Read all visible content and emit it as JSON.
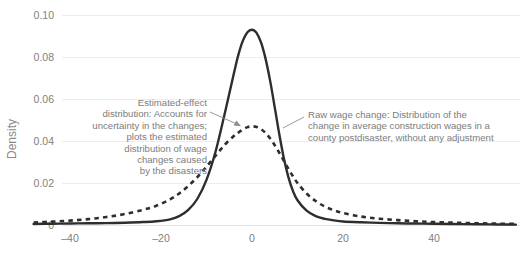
{
  "chart_data": {
    "type": "line",
    "title": "",
    "xlabel": "",
    "ylabel": "Density",
    "xlim": [
      -48,
      58
    ],
    "ylim": [
      0,
      0.104
    ],
    "grid": true,
    "legend_position": "none",
    "xticks": [
      -40,
      -20,
      0,
      20,
      40
    ],
    "xtick_labels": [
      "–40",
      "–20",
      "0",
      "20",
      "40"
    ],
    "yticks": [
      0,
      0.02,
      0.04,
      0.06,
      0.08,
      0.1
    ],
    "ytick_labels": [
      "0",
      "0.02",
      "0.04",
      "0.06",
      "0.08",
      "0.10"
    ],
    "series": [
      {
        "name": "Raw wage change",
        "style": "solid",
        "color": "#2e2e2e",
        "peak_x": 0.5,
        "peak_y": 0.093,
        "points": [
          [
            -48,
            0.0005
          ],
          [
            -44,
            0.0006
          ],
          [
            -40,
            0.0007
          ],
          [
            -36,
            0.0008
          ],
          [
            -32,
            0.0009
          ],
          [
            -28,
            0.0011
          ],
          [
            -24,
            0.0014
          ],
          [
            -21,
            0.0018
          ],
          [
            -18,
            0.0027
          ],
          [
            -16,
            0.0042
          ],
          [
            -14,
            0.0072
          ],
          [
            -12,
            0.0125
          ],
          [
            -10,
            0.0215
          ],
          [
            -8,
            0.035
          ],
          [
            -6,
            0.053
          ],
          [
            -4,
            0.072
          ],
          [
            -3,
            0.081
          ],
          [
            -2,
            0.0878
          ],
          [
            -1,
            0.0918
          ],
          [
            0,
            0.093
          ],
          [
            1,
            0.0915
          ],
          [
            2,
            0.0868
          ],
          [
            3,
            0.079
          ],
          [
            4,
            0.0685
          ],
          [
            5,
            0.056
          ],
          [
            6,
            0.0432
          ],
          [
            7,
            0.0318
          ],
          [
            8,
            0.0228
          ],
          [
            9,
            0.0162
          ],
          [
            10,
            0.0118
          ],
          [
            12,
            0.0068
          ],
          [
            14,
            0.0042
          ],
          [
            16,
            0.0029
          ],
          [
            18,
            0.0022
          ],
          [
            20,
            0.0017
          ],
          [
            24,
            0.0013
          ],
          [
            28,
            0.001
          ],
          [
            32,
            0.0008
          ],
          [
            36,
            0.0007
          ],
          [
            40,
            0.0006
          ],
          [
            46,
            0.0004
          ],
          [
            52,
            0.0003
          ],
          [
            58,
            0.0002
          ]
        ]
      },
      {
        "name": "Estimated-effect distribution",
        "style": "dashed",
        "color": "#2e2e2e",
        "peak_x": 0.0,
        "peak_y": 0.047,
        "points": [
          [
            -48,
            0.0012
          ],
          [
            -44,
            0.0016
          ],
          [
            -40,
            0.0021
          ],
          [
            -36,
            0.0028
          ],
          [
            -32,
            0.0038
          ],
          [
            -28,
            0.0052
          ],
          [
            -24,
            0.0072
          ],
          [
            -21,
            0.0092
          ],
          [
            -18,
            0.0122
          ],
          [
            -16,
            0.015
          ],
          [
            -14,
            0.0186
          ],
          [
            -12,
            0.0228
          ],
          [
            -10,
            0.0278
          ],
          [
            -8,
            0.033
          ],
          [
            -6,
            0.0382
          ],
          [
            -4,
            0.0424
          ],
          [
            -3,
            0.044
          ],
          [
            -2,
            0.0455
          ],
          [
            -1,
            0.0466
          ],
          [
            0,
            0.047
          ],
          [
            1,
            0.0467
          ],
          [
            2,
            0.0456
          ],
          [
            3,
            0.0438
          ],
          [
            4,
            0.0412
          ],
          [
            5,
            0.038
          ],
          [
            6,
            0.0344
          ],
          [
            7,
            0.0306
          ],
          [
            8,
            0.0268
          ],
          [
            9,
            0.0232
          ],
          [
            10,
            0.02
          ],
          [
            12,
            0.015
          ],
          [
            14,
            0.0114
          ],
          [
            16,
            0.0088
          ],
          [
            18,
            0.007
          ],
          [
            20,
            0.0057
          ],
          [
            24,
            0.004
          ],
          [
            28,
            0.003
          ],
          [
            32,
            0.0023
          ],
          [
            36,
            0.0018
          ],
          [
            40,
            0.0014
          ],
          [
            46,
            0.001
          ],
          [
            52,
            0.0007
          ],
          [
            58,
            0.0005
          ]
        ]
      }
    ],
    "annotations": [
      {
        "id": "estimated-effect",
        "target_series": "Estimated-effect distribution",
        "align": "right",
        "lines": [
          "Estimated-effect",
          "distribution: Accounts for",
          "uncertainty in the changes;",
          "plots the estimated",
          "distribution of wage",
          "changes caused",
          "by the disasters"
        ]
      },
      {
        "id": "raw-wage-change",
        "target_series": "Raw wage change",
        "align": "left",
        "lines": [
          "Raw wage change: Distribution of the",
          "change in average construction wages in a",
          "county postdisaster, without any adjustment"
        ]
      }
    ]
  }
}
